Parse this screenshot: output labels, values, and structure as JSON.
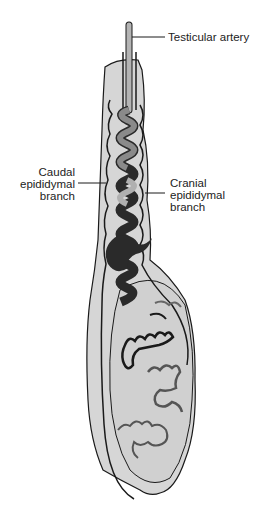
{
  "figure": {
    "labels": {
      "testicular_artery": "Testicular artery",
      "caudal_branch": [
        "Caudal",
        "epididymal",
        "branch"
      ],
      "cranial_branch": [
        "Cranial",
        "epididymal",
        "branch"
      ]
    }
  },
  "colors": {
    "organ_fill": "#d6d6d6",
    "outline": "#1a1a1a",
    "artery_light": "#a8a8a8",
    "artery_dark": "#2a2a2a",
    "artery_mid": "#6a6a6a"
  }
}
